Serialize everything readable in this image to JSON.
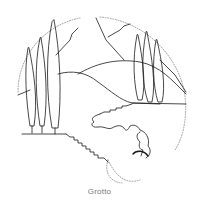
{
  "illustration": {
    "subject": "garden grotto with cypress trees and hills",
    "line_color": "#1a1a1a",
    "dotted_color": "#888888",
    "background": "#ffffff"
  },
  "caption": "Grotto"
}
